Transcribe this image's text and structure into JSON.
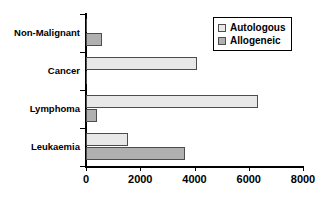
{
  "chart_data": {
    "type": "bar",
    "orientation": "horizontal",
    "title": "",
    "xlabel": "",
    "ylabel": "",
    "categories": [
      "Non-Malignant",
      "Cancer",
      "Lymphoma",
      "Leukaemia"
    ],
    "series": [
      {
        "name": "Autologous",
        "color": "#e8e8e8",
        "values": [
          0,
          4100,
          6350,
          1550
        ]
      },
      {
        "name": "Allogeneic",
        "color": "#b0b0b0",
        "values": [
          600,
          0,
          400,
          3650
        ]
      }
    ],
    "xlim": [
      0,
      8000
    ],
    "xticks": [
      0,
      2000,
      4000,
      6000,
      8000
    ],
    "xtick_labels": [
      "0",
      "2000",
      "4000",
      "6000",
      "8000"
    ],
    "grid": false,
    "legend_position": "top-right"
  },
  "legend": {
    "entries": [
      {
        "label": "Autologous"
      },
      {
        "label": "Allogeneic"
      }
    ]
  },
  "colors": {
    "autologous_fill": "#e8e8e8",
    "allogeneic_fill": "#b0b0b0",
    "bar_border": "#4d4d4d",
    "axis": "#000000",
    "background": "#ffffff"
  }
}
